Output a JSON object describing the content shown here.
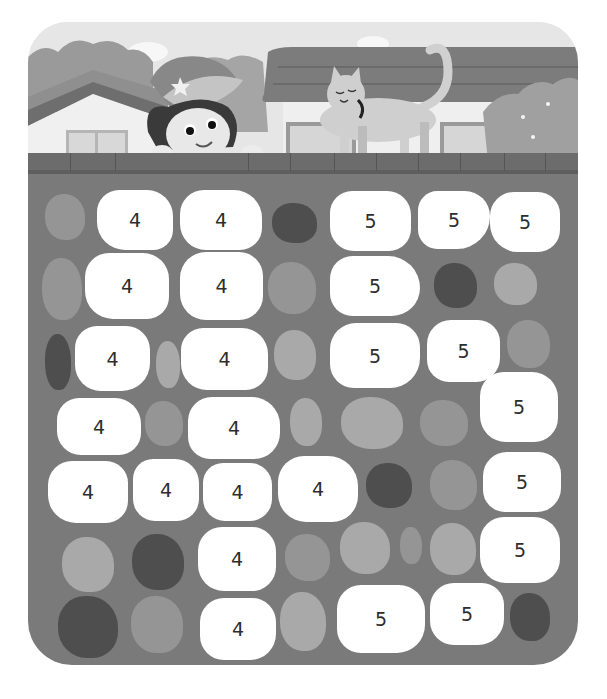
{
  "puzzle": {
    "description": "Stepping-stone path puzzle: stones numbered 4 and 5",
    "stones": [
      {
        "label": "4",
        "x": 97,
        "y": 190,
        "w": 76,
        "h": 60,
        "r": "22px 26px 20px 28px"
      },
      {
        "label": "4",
        "x": 180,
        "y": 190,
        "w": 82,
        "h": 60,
        "r": "24px 28px 22px 26px"
      },
      {
        "label": "5",
        "x": 330,
        "y": 191,
        "w": 81,
        "h": 60,
        "r": "22px 24px 22px 24px"
      },
      {
        "label": "5",
        "x": 418,
        "y": 191,
        "w": 72,
        "h": 58,
        "r": "20px 26px 34px 20px"
      },
      {
        "label": "5",
        "x": 490,
        "y": 192,
        "w": 70,
        "h": 60,
        "r": "24px 22px 22px 28px"
      },
      {
        "label": "4",
        "x": 85,
        "y": 253,
        "w": 84,
        "h": 66,
        "r": "24px 26px 22px 28px"
      },
      {
        "label": "4",
        "x": 180,
        "y": 252,
        "w": 83,
        "h": 68,
        "r": "26px 24px 24px 26px"
      },
      {
        "label": "5",
        "x": 330,
        "y": 256,
        "w": 90,
        "h": 60,
        "r": "24px 34px 30px 24px"
      },
      {
        "label": "4",
        "x": 75,
        "y": 326,
        "w": 75,
        "h": 65,
        "r": "22px 24px 28px 26px"
      },
      {
        "label": "4",
        "x": 181,
        "y": 328,
        "w": 87,
        "h": 62,
        "r": "22px 26px 22px 26px"
      },
      {
        "label": "5",
        "x": 330,
        "y": 323,
        "w": 90,
        "h": 65,
        "r": "26px 24px 30px 24px"
      },
      {
        "label": "5",
        "x": 427,
        "y": 320,
        "w": 73,
        "h": 62,
        "r": "24px 22px 24px 22px"
      },
      {
        "label": "4",
        "x": 57,
        "y": 398,
        "w": 84,
        "h": 57,
        "r": "22px 26px 22px 24px"
      },
      {
        "label": "4",
        "x": 188,
        "y": 397,
        "w": 92,
        "h": 62,
        "r": "24px 28px 26px 22px"
      },
      {
        "label": "5",
        "x": 480,
        "y": 372,
        "w": 78,
        "h": 70,
        "r": "24px 26px 24px 26px"
      },
      {
        "label": "4",
        "x": 48,
        "y": 461,
        "w": 80,
        "h": 62,
        "r": "24px 22px 22px 28px"
      },
      {
        "label": "4",
        "x": 133,
        "y": 459,
        "w": 66,
        "h": 62,
        "r": "20px 24px 22px 22px"
      },
      {
        "label": "4",
        "x": 203,
        "y": 463,
        "w": 69,
        "h": 58,
        "r": "20px 22px 22px 22px"
      },
      {
        "label": "4",
        "x": 278,
        "y": 456,
        "w": 80,
        "h": 66,
        "r": "26px 30px 26px 28px"
      },
      {
        "label": "5",
        "x": 483,
        "y": 452,
        "w": 78,
        "h": 60,
        "r": "24px 22px 24px 22px"
      },
      {
        "label": "4",
        "x": 198,
        "y": 527,
        "w": 78,
        "h": 64,
        "r": "24px 24px 24px 26px"
      },
      {
        "label": "5",
        "x": 480,
        "y": 517,
        "w": 80,
        "h": 66,
        "r": "24px 26px 24px 26px"
      },
      {
        "label": "4",
        "x": 200,
        "y": 598,
        "w": 76,
        "h": 62,
        "r": "24px 24px 26px 24px"
      },
      {
        "label": "5",
        "x": 337,
        "y": 585,
        "w": 88,
        "h": 68,
        "r": "24px 26px 28px 24px"
      },
      {
        "label": "5",
        "x": 430,
        "y": 583,
        "w": 74,
        "h": 62,
        "r": "24px 22px 26px 24px"
      }
    ],
    "decorative_stones": [
      {
        "tone": "mid",
        "x": 45,
        "y": 194,
        "w": 40,
        "h": 46
      },
      {
        "tone": "dark",
        "x": 272,
        "y": 203,
        "w": 45,
        "h": 40
      },
      {
        "tone": "mid",
        "x": 42,
        "y": 258,
        "w": 40,
        "h": 62
      },
      {
        "tone": "mid",
        "x": 268,
        "y": 262,
        "w": 48,
        "h": 52
      },
      {
        "tone": "dark",
        "x": 434,
        "y": 263,
        "w": 43,
        "h": 45
      },
      {
        "tone": "light",
        "x": 494,
        "y": 263,
        "w": 43,
        "h": 42
      },
      {
        "tone": "dark",
        "x": 45,
        "y": 334,
        "w": 26,
        "h": 56
      },
      {
        "tone": "light",
        "x": 156,
        "y": 341,
        "w": 24,
        "h": 47
      },
      {
        "tone": "light",
        "x": 274,
        "y": 330,
        "w": 42,
        "h": 50
      },
      {
        "tone": "mid",
        "x": 507,
        "y": 320,
        "w": 43,
        "h": 48
      },
      {
        "tone": "mid",
        "x": 145,
        "y": 401,
        "w": 38,
        "h": 45
      },
      {
        "tone": "light",
        "x": 290,
        "y": 398,
        "w": 32,
        "h": 48
      },
      {
        "tone": "light",
        "x": 341,
        "y": 397,
        "w": 62,
        "h": 52
      },
      {
        "tone": "mid",
        "x": 420,
        "y": 400,
        "w": 48,
        "h": 46
      },
      {
        "tone": "dark",
        "x": 366,
        "y": 463,
        "w": 46,
        "h": 45
      },
      {
        "tone": "mid",
        "x": 430,
        "y": 460,
        "w": 47,
        "h": 50
      },
      {
        "tone": "light",
        "x": 62,
        "y": 537,
        "w": 52,
        "h": 55
      },
      {
        "tone": "dark",
        "x": 132,
        "y": 534,
        "w": 52,
        "h": 56
      },
      {
        "tone": "mid",
        "x": 285,
        "y": 534,
        "w": 45,
        "h": 47
      },
      {
        "tone": "light",
        "x": 340,
        "y": 522,
        "w": 50,
        "h": 52
      },
      {
        "tone": "mid",
        "x": 400,
        "y": 527,
        "w": 22,
        "h": 37
      },
      {
        "tone": "light",
        "x": 430,
        "y": 523,
        "w": 46,
        "h": 52
      },
      {
        "tone": "dark",
        "x": 58,
        "y": 596,
        "w": 60,
        "h": 62
      },
      {
        "tone": "mid",
        "x": 131,
        "y": 596,
        "w": 52,
        "h": 57
      },
      {
        "tone": "light",
        "x": 280,
        "y": 592,
        "w": 46,
        "h": 59
      },
      {
        "tone": "dark",
        "x": 510,
        "y": 593,
        "w": 40,
        "h": 48
      }
    ]
  },
  "scene": {
    "characters": [
      "child-with-cap",
      "cat"
    ],
    "background": [
      "houses",
      "bushes",
      "clouds",
      "brick-wall"
    ]
  },
  "colors": {
    "board": "#7a7a7a",
    "stone_numbered": "#ffffff",
    "stone_light": "#a9a9a9",
    "stone_mid": "#959595",
    "stone_dark": "#4e4e4e",
    "text": "#2d2d2d"
  }
}
